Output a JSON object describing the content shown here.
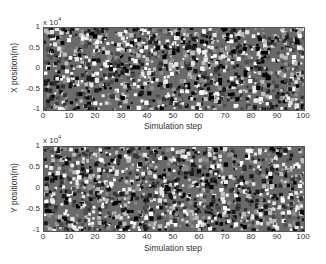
{
  "chart_data": [
    {
      "type": "scatter",
      "title": "",
      "xlabel": "Simulation step",
      "ylabel": "X position(m)",
      "y_exponent": "x 10",
      "y_exponent_power": "4",
      "xlim": [
        0,
        100
      ],
      "ylim": [
        -10000,
        10000
      ],
      "xticks": [
        "0",
        "10",
        "20",
        "30",
        "40",
        "50",
        "60",
        "70",
        "80",
        "90",
        "100"
      ],
      "yticks": [
        "1",
        "0.5",
        "0",
        "-0.5",
        "-1"
      ],
      "grid": false,
      "series": [
        {
          "name": "particles",
          "description": "dense uniformly distributed particle positions across all steps, range -1e4 to 1e4, black/gray markers",
          "density": 1400,
          "seed": 7
        }
      ]
    },
    {
      "type": "scatter",
      "title": "",
      "xlabel": "Simulation step",
      "ylabel": "Y position(m)",
      "y_exponent": "x 10",
      "y_exponent_power": "4",
      "xlim": [
        0,
        100
      ],
      "ylim": [
        -10000,
        10000
      ],
      "xticks": [
        "0",
        "10",
        "20",
        "30",
        "40",
        "50",
        "60",
        "70",
        "80",
        "90",
        "100"
      ],
      "yticks": [
        "1",
        "0.5",
        "0",
        "-0.5",
        "-1"
      ],
      "grid": false,
      "series": [
        {
          "name": "particles",
          "description": "dense uniformly distributed particle positions across all steps, range -1e4 to 1e4, black/gray markers",
          "density": 1400,
          "seed": 19
        }
      ]
    }
  ]
}
